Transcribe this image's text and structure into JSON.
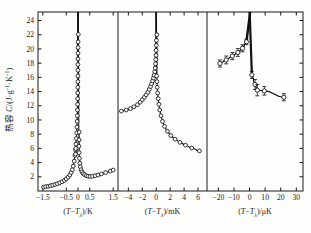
{
  "figure": {
    "background_color": "#fdfdfb",
    "axis_color": "#1a1a1a",
    "curve_color": "#111111",
    "marker_fill": "#ffffff"
  },
  "yaxis": {
    "label_cjk": "热容",
    "label_symbol": "C",
    "label_units_open": "/(J",
    "label_dot": "·",
    "label_g": "g",
    "label_g_exp": "-1",
    "label_K": "K",
    "label_K_exp": "-1",
    "label_close": ")",
    "ticks": [
      2,
      4,
      6,
      8,
      10,
      12,
      14,
      16,
      18,
      20,
      22,
      24
    ],
    "range": [
      0,
      25.2
    ]
  },
  "panels": [
    {
      "id": "panel-kelvin",
      "xlabel_prefix": "(",
      "xlabel_T": "T",
      "xlabel_minus": "−",
      "xlabel_Tl": "T",
      "xlabel_lambda": "λ",
      "xlabel_suffix": ")/K",
      "xticks": [
        -1.5,
        -0.5,
        0,
        0.5,
        1.5
      ],
      "xtick_labels": [
        "-1.5",
        "-0.5",
        "0",
        "0.5",
        "1.5"
      ],
      "xrange": [
        -1.62,
        1.62
      ],
      "has_error_bars": false
    },
    {
      "id": "panel-millikelvin",
      "xlabel_prefix": "(",
      "xlabel_T": "T",
      "xlabel_minus": "−",
      "xlabel_Tl": "T",
      "xlabel_lambda": "λ",
      "xlabel_suffix": ")/mK",
      "xticks": [
        -4,
        -2,
        0,
        2,
        4,
        6
      ],
      "xtick_labels": [
        "-4",
        "-2",
        "0",
        "2",
        "4",
        "6"
      ],
      "xrange": [
        -5.2,
        7.0
      ],
      "has_error_bars": false
    },
    {
      "id": "panel-microkelvin",
      "xlabel_prefix": "(",
      "xlabel_T": "T",
      "xlabel_minus": "−",
      "xlabel_Tl": "T",
      "xlabel_lambda": "λ",
      "xlabel_suffix": ")/μK",
      "xticks": [
        -20,
        -10,
        0,
        10,
        20,
        30
      ],
      "xtick_labels": [
        "-20",
        "-10",
        "0",
        "10",
        "20",
        "30"
      ],
      "xrange": [
        -26,
        33
      ],
      "has_error_bars": true
    }
  ],
  "chart_data": {
    "type": "scatter",
    "title": "",
    "ylabel": "热容 C/(J·g⁻¹·K⁻¹)",
    "ylim": [
      0,
      25.2
    ],
    "grid": false,
    "legend": "none",
    "panels": [
      {
        "name": "panel-kelvin",
        "xlabel": "(T−Tλ)/K",
        "xlim": [
          -1.62,
          1.62
        ],
        "xticks": [
          -1.5,
          -0.5,
          0,
          0.5,
          1.5
        ],
        "points": [
          {
            "x": -1.47,
            "y": 0.55
          },
          {
            "x": -1.38,
            "y": 0.6
          },
          {
            "x": -1.28,
            "y": 0.66
          },
          {
            "x": -1.18,
            "y": 0.74
          },
          {
            "x": -1.08,
            "y": 0.82
          },
          {
            "x": -0.98,
            "y": 0.92
          },
          {
            "x": -0.88,
            "y": 1.02
          },
          {
            "x": -0.78,
            "y": 1.15
          },
          {
            "x": -0.68,
            "y": 1.3
          },
          {
            "x": -0.58,
            "y": 1.5
          },
          {
            "x": -0.5,
            "y": 1.7
          },
          {
            "x": -0.42,
            "y": 1.95
          },
          {
            "x": -0.35,
            "y": 2.25
          },
          {
            "x": -0.29,
            "y": 2.6
          },
          {
            "x": -0.24,
            "y": 3.0
          },
          {
            "x": -0.2,
            "y": 3.5
          },
          {
            "x": -0.16,
            "y": 4.2
          },
          {
            "x": -0.13,
            "y": 5.0
          },
          {
            "x": -0.105,
            "y": 5.8
          },
          {
            "x": -0.085,
            "y": 6.6
          },
          {
            "x": -0.07,
            "y": 7.4
          },
          {
            "x": -0.057,
            "y": 8.2
          },
          {
            "x": -0.046,
            "y": 9.0
          },
          {
            "x": -0.037,
            "y": 9.8
          },
          {
            "x": -0.029,
            "y": 10.6
          },
          {
            "x": -0.023,
            "y": 11.4
          },
          {
            "x": -0.018,
            "y": 12.2
          },
          {
            "x": -0.014,
            "y": 13.0
          },
          {
            "x": -0.011,
            "y": 13.8
          },
          {
            "x": -0.008,
            "y": 14.6
          },
          {
            "x": -0.006,
            "y": 15.4
          },
          {
            "x": -0.0045,
            "y": 16.2
          },
          {
            "x": -0.003,
            "y": 17.0
          },
          {
            "x": -0.002,
            "y": 17.8
          },
          {
            "x": -0.0012,
            "y": 18.6
          },
          {
            "x": 0.0014,
            "y": 19.4
          },
          {
            "x": 0.0022,
            "y": 20.2
          },
          {
            "x": 0.0036,
            "y": 21.0
          },
          {
            "x": 0.013,
            "y": 22.05
          },
          {
            "x": -0.105,
            "y": 5.2
          },
          {
            "x": -0.09,
            "y": 6.0
          },
          {
            "x": 0.05,
            "y": 8.3
          },
          {
            "x": 0.045,
            "y": 7.2
          },
          {
            "x": 0.04,
            "y": 6.3
          },
          {
            "x": 0.05,
            "y": 5.4
          },
          {
            "x": 0.062,
            "y": 4.6
          },
          {
            "x": 0.08,
            "y": 3.9
          },
          {
            "x": 0.1,
            "y": 3.4
          },
          {
            "x": 0.13,
            "y": 3.0
          },
          {
            "x": 0.17,
            "y": 2.7
          },
          {
            "x": 0.22,
            "y": 2.45
          },
          {
            "x": 0.28,
            "y": 2.3
          },
          {
            "x": 0.35,
            "y": 2.15
          },
          {
            "x": 0.43,
            "y": 2.08
          },
          {
            "x": 0.52,
            "y": 2.05
          },
          {
            "x": 0.62,
            "y": 2.08
          },
          {
            "x": 0.73,
            "y": 2.15
          },
          {
            "x": 0.85,
            "y": 2.25
          },
          {
            "x": 1.0,
            "y": 2.4
          },
          {
            "x": 1.18,
            "y": 2.6
          },
          {
            "x": 1.38,
            "y": 2.8
          },
          {
            "x": 1.5,
            "y": 2.95
          }
        ]
      },
      {
        "name": "panel-millikelvin",
        "xlabel": "(T−Tλ)/mK",
        "xlim": [
          -5.2,
          7.0
        ],
        "xticks": [
          -4,
          -2,
          0,
          2,
          4,
          6
        ],
        "points": [
          {
            "x": -5.0,
            "y": 11.25
          },
          {
            "x": -4.3,
            "y": 11.4
          },
          {
            "x": -3.7,
            "y": 11.6
          },
          {
            "x": -3.2,
            "y": 11.85
          },
          {
            "x": -2.7,
            "y": 12.15
          },
          {
            "x": -2.3,
            "y": 12.5
          },
          {
            "x": -2.0,
            "y": 12.85
          },
          {
            "x": -1.7,
            "y": 13.2
          },
          {
            "x": -1.45,
            "y": 13.55
          },
          {
            "x": -1.2,
            "y": 13.9
          },
          {
            "x": -1.0,
            "y": 14.3
          },
          {
            "x": -0.82,
            "y": 14.7
          },
          {
            "x": -0.66,
            "y": 15.1
          },
          {
            "x": -0.52,
            "y": 15.5
          },
          {
            "x": -0.4,
            "y": 15.9
          },
          {
            "x": -0.3,
            "y": 16.3
          },
          {
            "x": -0.22,
            "y": 16.8
          },
          {
            "x": -0.15,
            "y": 17.3
          },
          {
            "x": -0.1,
            "y": 17.9
          },
          {
            "x": -0.06,
            "y": 18.5
          },
          {
            "x": -0.03,
            "y": 19.1
          },
          {
            "x": -0.015,
            "y": 19.8
          },
          {
            "x": 0.01,
            "y": 20.5
          },
          {
            "x": 0.03,
            "y": 21.2
          },
          {
            "x": 0.09,
            "y": 22.0
          },
          {
            "x": 0.06,
            "y": 16.2
          },
          {
            "x": 0.1,
            "y": 15.4
          },
          {
            "x": 0.14,
            "y": 14.6
          },
          {
            "x": 0.2,
            "y": 13.8
          },
          {
            "x": 0.28,
            "y": 13.0
          },
          {
            "x": 0.38,
            "y": 12.2
          },
          {
            "x": 0.5,
            "y": 11.4
          },
          {
            "x": 0.68,
            "y": 10.6
          },
          {
            "x": 0.9,
            "y": 9.8
          },
          {
            "x": 1.2,
            "y": 9.1
          },
          {
            "x": 1.6,
            "y": 8.4
          },
          {
            "x": 2.1,
            "y": 7.8
          },
          {
            "x": 2.7,
            "y": 7.3
          },
          {
            "x": 3.4,
            "y": 6.85
          },
          {
            "x": 4.2,
            "y": 6.45
          },
          {
            "x": 5.1,
            "y": 6.05
          },
          {
            "x": 6.2,
            "y": 5.65
          }
        ]
      },
      {
        "name": "panel-microkelvin",
        "xlabel": "(T−Tλ)/μK",
        "xlim": [
          -26,
          33
        ],
        "xticks": [
          -20,
          -10,
          0,
          10,
          20,
          30
        ],
        "points": [
          {
            "x": -19.0,
            "y": 17.95,
            "yerr": 0.5
          },
          {
            "x": -15.0,
            "y": 18.45,
            "yerr": 0.55
          },
          {
            "x": -11.0,
            "y": 19.0,
            "yerr": 0.5
          },
          {
            "x": -7.5,
            "y": 19.5,
            "yerr": 0.55
          },
          {
            "x": -4.5,
            "y": 20.1,
            "yerr": 0.5
          },
          {
            "x": -2.0,
            "y": 21.0,
            "yerr": 0.4
          },
          {
            "x": 1.5,
            "y": 16.35,
            "yerr": 0.5
          },
          {
            "x": 3.5,
            "y": 15.0,
            "yerr": 0.7
          },
          {
            "x": 5.0,
            "y": 14.2,
            "yerr": 0.8
          },
          {
            "x": 9.5,
            "y": 14.1,
            "yerr": 0.6
          },
          {
            "x": 22.0,
            "y": 13.2,
            "yerr": 0.5
          }
        ]
      }
    ]
  }
}
